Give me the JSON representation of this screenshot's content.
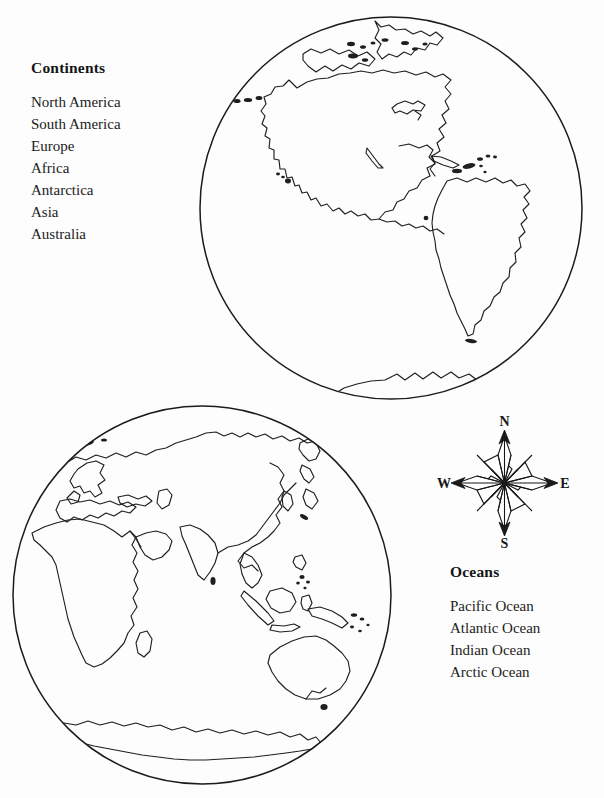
{
  "page": {
    "background_color": "#fdfdfd",
    "ink_color": "#1a1a1a",
    "width": 604,
    "height": 798
  },
  "continents_legend": {
    "title": "Continents",
    "items": [
      "North America",
      "South America",
      "Europe",
      "Africa",
      "Antarctica",
      "Asia",
      "Australia"
    ]
  },
  "oceans_legend": {
    "title": "Oceans",
    "items": [
      "Pacific Ocean",
      "Atlantic Ocean",
      "Indian Ocean",
      "Arctic Ocean"
    ]
  },
  "compass_rose": {
    "north_label": "N",
    "east_label": "E",
    "south_label": "S",
    "west_label": "W"
  },
  "globes": [
    {
      "id": "western-hemisphere",
      "landmasses": [
        "North America",
        "South America",
        "Antarctica",
        "Greenland"
      ]
    },
    {
      "id": "eastern-hemisphere",
      "landmasses": [
        "Europe",
        "Africa",
        "Asia",
        "Australia",
        "Antarctica"
      ]
    }
  ]
}
